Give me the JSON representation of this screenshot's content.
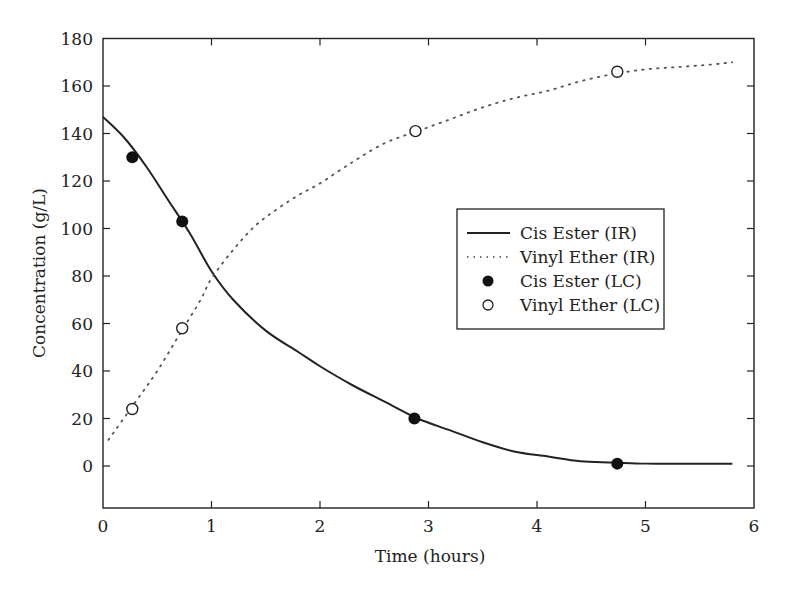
{
  "chart_data": {
    "type": "line",
    "title": "",
    "xlabel": "Time (hours)",
    "ylabel": "Concentration (g/L)",
    "xlim": [
      0,
      6
    ],
    "ylim": [
      -18,
      180
    ],
    "xticks": [
      0,
      1,
      2,
      3,
      4,
      5,
      6
    ],
    "yticks": [
      0,
      20,
      40,
      60,
      80,
      100,
      120,
      140,
      160,
      180
    ],
    "grid": false,
    "legend_position": "center-right",
    "series": [
      {
        "name": "Cis Ester (IR)",
        "style": "solid-line",
        "x": [
          0,
          0.2,
          0.4,
          0.6,
          0.8,
          1.0,
          1.2,
          1.5,
          1.8,
          2.0,
          2.3,
          2.6,
          2.9,
          3.2,
          3.5,
          3.8,
          4.1,
          4.4,
          4.7,
          5.0,
          5.3,
          5.6,
          5.8
        ],
        "y": [
          147,
          138,
          126,
          112,
          98,
          82,
          70,
          57,
          48,
          42,
          34,
          27,
          20,
          15,
          10,
          6,
          4,
          2,
          1.5,
          1,
          1,
          1,
          1
        ]
      },
      {
        "name": "Vinyl Ether (IR)",
        "style": "dotted-line",
        "x": [
          0.05,
          0.3,
          0.5,
          0.7,
          0.9,
          1.0,
          1.2,
          1.4,
          1.6,
          1.8,
          2.0,
          2.3,
          2.6,
          2.9,
          3.2,
          3.5,
          3.8,
          4.1,
          4.4,
          4.7,
          5.0,
          5.3,
          5.6,
          5.8
        ],
        "y": [
          11,
          27,
          40,
          55,
          70,
          79,
          91,
          101,
          108,
          114,
          119,
          128,
          136,
          141,
          146,
          151,
          155,
          158,
          162,
          165,
          167,
          168,
          169,
          170
        ]
      },
      {
        "name": "Cis Ester (LC)",
        "style": "filled-circle",
        "x": [
          0.27,
          0.73,
          2.87,
          4.74
        ],
        "y": [
          130,
          103,
          20,
          1
        ]
      },
      {
        "name": "Vinyl Ether (LC)",
        "style": "open-circle",
        "x": [
          0.27,
          0.73,
          2.88,
          4.74
        ],
        "y": [
          24,
          58,
          141,
          166
        ]
      }
    ]
  },
  "legend": {
    "items": [
      {
        "label": "Cis Ester (IR)"
      },
      {
        "label": "Vinyl Ether (IR)"
      },
      {
        "label": "Cis Ester (LC)"
      },
      {
        "label": "Vinyl Ether (LC)"
      }
    ]
  },
  "axes": {
    "xlabel": "Time (hours)",
    "ylabel": "Concentration (g/L)"
  },
  "colors": {
    "ink": "#222222",
    "background": "#ffffff"
  }
}
